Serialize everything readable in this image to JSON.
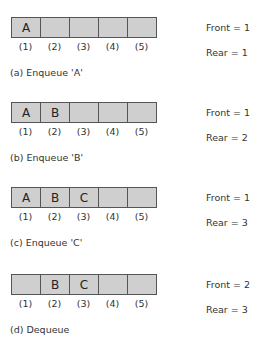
{
  "panels": [
    {
      "cells": [
        "A",
        "",
        "",
        "",
        ""
      ],
      "indices": [
        "(1)",
        "(2)",
        "(3)",
        "(4)",
        "(5)"
      ],
      "front": "Front = 1",
      "rear": "Rear = 1",
      "caption": "(a) Enqueue 'A'"
    },
    {
      "cells": [
        "A",
        "B",
        "",
        "",
        ""
      ],
      "indices": [
        "(1)",
        "(2)",
        "(3)",
        "(4)",
        "(5)"
      ],
      "front": "Front = 1",
      "rear": "Rear = 2",
      "caption": "(b) Enqueue 'B'"
    },
    {
      "cells": [
        "A",
        "B",
        "C",
        "",
        ""
      ],
      "indices": [
        "(1)",
        "(2)",
        "(3)",
        "(4)",
        "(5)"
      ],
      "front": "Front = 1",
      "rear": "Rear = 3",
      "caption": "(c) Enqueue 'C'"
    },
    {
      "cells": [
        "",
        "B",
        "C",
        "",
        ""
      ],
      "indices": [
        "(1)",
        "(2)",
        "(3)",
        "(4)",
        "(5)"
      ],
      "front": "Front = 2",
      "rear": "Rear = 3",
      "caption": "(d) Dequeue"
    }
  ],
  "colors": {
    "cell_fill": "#cfcfcf",
    "border": "#555555"
  }
}
